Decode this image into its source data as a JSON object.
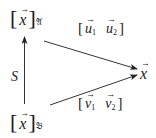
{
  "diagram": {
    "nodes": {
      "basis_a": {
        "vector": "x",
        "subscript": "𝔄",
        "open_bracket": "[",
        "close_bracket": "]"
      },
      "basis_b": {
        "vector": "x",
        "subscript": "𝔅",
        "open_bracket": "[",
        "close_bracket": "]"
      },
      "target": {
        "vector": "x"
      }
    },
    "edges": {
      "change_of_basis": {
        "label": "S",
        "from": "basis_b",
        "to": "basis_a"
      },
      "upper": {
        "open_bracket": "[",
        "close_bracket": "]",
        "col1_vector": "u",
        "col1_sub": "1",
        "col2_vector": "u",
        "col2_sub": "2",
        "from": "basis_a",
        "to": "target"
      },
      "lower": {
        "open_bracket": "[",
        "close_bracket": "]",
        "col1_vector": "v",
        "col1_sub": "1",
        "col2_vector": "v",
        "col2_sub": "2",
        "from": "basis_b",
        "to": "target"
      }
    },
    "colors": {
      "ink": "#1a1a1a",
      "line": "#333333",
      "background": "#ffffff"
    }
  }
}
